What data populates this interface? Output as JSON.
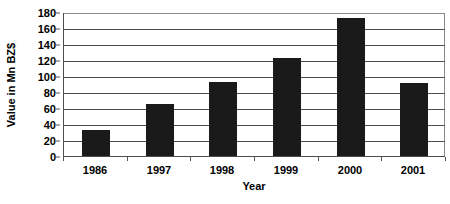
{
  "chart_data": {
    "type": "bar",
    "title": "",
    "subtitle": "",
    "xlabel": "Year",
    "ylabel": "Value in Mn BZ$",
    "categories": [
      "1986",
      "1997",
      "1998",
      "1999",
      "2000",
      "2001"
    ],
    "values": [
      32,
      65,
      93,
      122,
      172,
      91
    ],
    "series": [
      {
        "name": "Value in Mn BZ$",
        "values": [
          32,
          65,
          93,
          122,
          172,
          91
        ]
      }
    ],
    "ylim": [
      0,
      180
    ],
    "ytick_step": 20,
    "ytick_labels": [
      "0",
      "20",
      "40",
      "60",
      "80",
      "100",
      "120",
      "140",
      "160",
      "180"
    ],
    "ytick_values": [
      0,
      20,
      40,
      60,
      80,
      100,
      120,
      140,
      160,
      180
    ],
    "grid": true,
    "grid_axis": "y",
    "legend": false,
    "legend_position": "none",
    "annotations": [],
    "colors": {
      "bar_fill": "#1a1a1a",
      "plot_background": "#ffffff",
      "gridline": "#4d4d4d",
      "axis_line": "#4d4d4d",
      "frame_light": "#8a8a8a",
      "text": "#000000"
    }
  }
}
